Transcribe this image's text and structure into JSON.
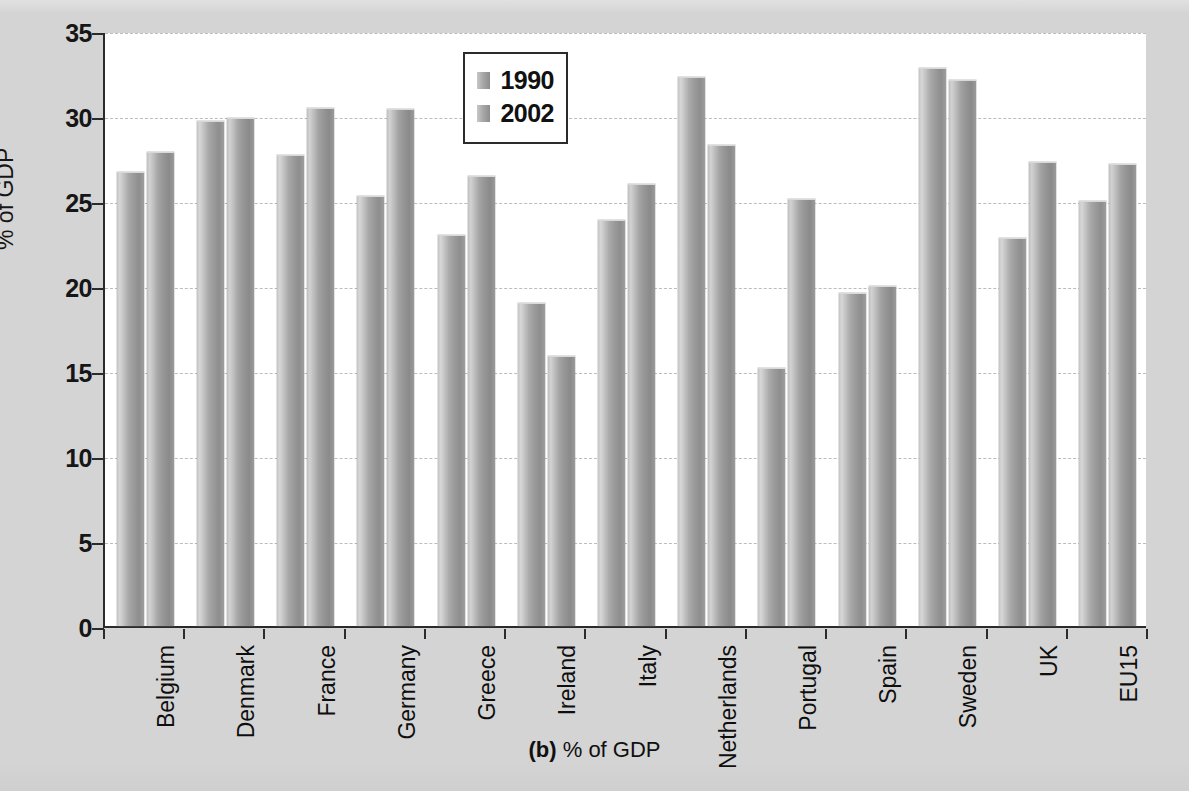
{
  "caption": {
    "prefix": "(b)",
    "text": "% of GDP"
  },
  "legend": {
    "position": "inside-top-center",
    "items": [
      {
        "label": "1990",
        "color": "#a8a8a8"
      },
      {
        "label": "2002",
        "color": "#a4a4a4"
      }
    ]
  },
  "axes": {
    "ylabel": "% of GDP",
    "yticks": [
      "0",
      "5",
      "10",
      "15",
      "20",
      "25",
      "30",
      "35"
    ],
    "xlabel": ""
  },
  "chart_data": {
    "type": "bar",
    "title": "",
    "subtitle": "",
    "xlabel": "",
    "ylabel": "% of GDP",
    "ylim": [
      0,
      35
    ],
    "ytick_step": 5,
    "grid": true,
    "legend_position": "inside-top-center",
    "annotation": "(b) % of GDP",
    "categories": [
      "Belgium",
      "Denmark",
      "France",
      "Germany",
      "Greece",
      "Ireland",
      "Italy",
      "Netherlands",
      "Portugal",
      "Spain",
      "Sweden",
      "UK",
      "EU15"
    ],
    "series": [
      {
        "name": "1990",
        "values": [
          26.7,
          29.7,
          27.7,
          25.3,
          23.0,
          19.0,
          23.9,
          32.3,
          15.2,
          19.6,
          32.8,
          22.8,
          25.0
        ]
      },
      {
        "name": "2002",
        "values": [
          27.9,
          29.9,
          30.5,
          30.4,
          26.5,
          15.9,
          26.0,
          28.3,
          25.1,
          20.0,
          32.1,
          27.3,
          27.2
        ]
      }
    ]
  }
}
